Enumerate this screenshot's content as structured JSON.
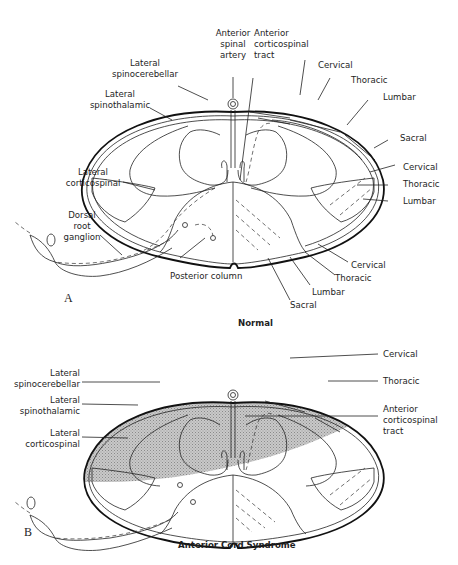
{
  "figure_a": {
    "panel_letter": "A",
    "caption": "Normal",
    "labels": {
      "anterior_spinal_artery": [
        "Anterior",
        "spinal",
        "artery"
      ],
      "anterior_corticospinal_tract": [
        "Anterior",
        "corticospinal",
        "tract"
      ],
      "lateral_spinocerebellar": [
        "Lateral",
        "spinocerebellar"
      ],
      "lateral_spinothalamic": [
        "Lateral",
        "spinothalamic"
      ],
      "lateral_corticospinal": [
        "Lateral",
        "corticospinal"
      ],
      "dorsal_root_ganglion": [
        "Dorsal",
        "root",
        "ganglion"
      ],
      "posterior_column": "Posterior column",
      "spinothalamic_segments": [
        "Cervical",
        "Thoracic",
        "Lumbar",
        "Sacral"
      ],
      "corticospinal_segments": [
        "Cervical",
        "Thoracic",
        "Lumbar"
      ],
      "posterior_column_segments": [
        "Cervical",
        "Thoracic",
        "Lumbar",
        "Sacral"
      ]
    }
  },
  "figure_b": {
    "panel_letter": "B",
    "caption": "Anterior Cord Syndrome",
    "labels": {
      "lateral_spinocerebellar": [
        "Lateral",
        "spinocerebellar"
      ],
      "lateral_spinothalamic": [
        "Lateral",
        "spinothalamic"
      ],
      "lateral_corticospinal": [
        "Lateral",
        "corticospinal"
      ],
      "cervical": "Cervical",
      "thoracic": "Thoracic",
      "anterior_corticospinal_tract": [
        "Anterior",
        "corticospinal",
        "tract"
      ]
    },
    "shading": {
      "pattern": "stippled",
      "color": "#b8b8b8",
      "region": "anterior two-thirds of cord"
    }
  }
}
